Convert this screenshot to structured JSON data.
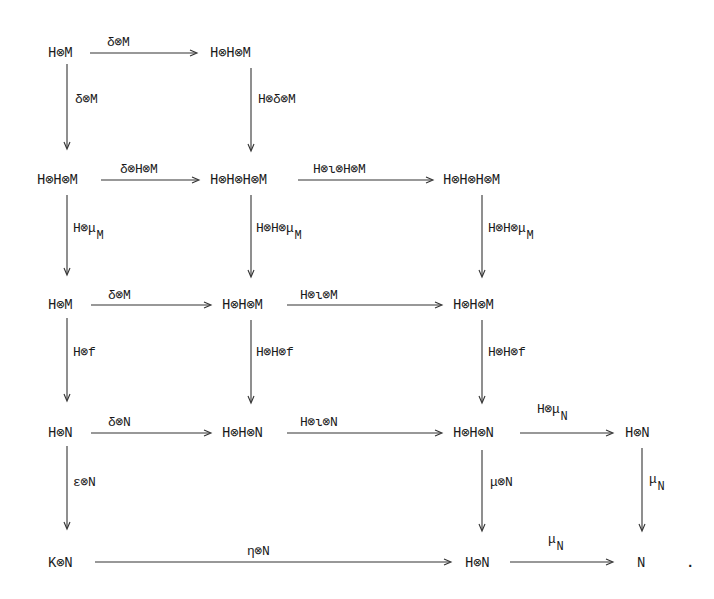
{
  "diagram": {
    "type": "commutative-diagram",
    "nodes": {
      "r1c1": "H⊗M",
      "r1c2": "H⊗H⊗M",
      "r2c1": "H⊗H⊗M",
      "r2c2": "H⊗H⊗H⊗M",
      "r2c3": "H⊗H⊗H⊗M",
      "r3c1": "H⊗M",
      "r3c2": "H⊗H⊗M",
      "r3c3": "H⊗H⊗M",
      "r4c1": "H⊗N",
      "r4c2": "H⊗H⊗N",
      "r4c3": "H⊗H⊗N",
      "r4c4": "H⊗N",
      "r5c1": "K⊗N",
      "r5c3": "H⊗N",
      "r5c4": "N",
      "period": "."
    },
    "edges": {
      "r1_h1": {
        "label": "δ⊗M"
      },
      "r1c1_down": {
        "label": "δ⊗M"
      },
      "r1c2_down": {
        "label": "H⊗δ⊗M"
      },
      "r2_h1": {
        "label": "δ⊗H⊗M"
      },
      "r2_h2": {
        "label": "H⊗ι⊗H⊗M"
      },
      "r2c1_down": {
        "label": "H⊗μ",
        "sub": "M"
      },
      "r2c2_down": {
        "label": "H⊗H⊗μ",
        "sub": "M"
      },
      "r2c3_down": {
        "label": "H⊗H⊗μ",
        "sub": "M"
      },
      "r3_h1": {
        "label": "δ⊗M"
      },
      "r3_h2": {
        "label": "H⊗ι⊗M"
      },
      "r3c1_down": {
        "label": "H⊗f"
      },
      "r3c2_down": {
        "label": "H⊗H⊗f"
      },
      "r3c3_down": {
        "label": "H⊗H⊗f"
      },
      "r4_h1": {
        "label": "δ⊗N"
      },
      "r4_h2": {
        "label": "H⊗ι⊗N"
      },
      "r4_h3": {
        "label": "H⊗μ",
        "sub": "N"
      },
      "r4c1_down": {
        "label": "ε⊗N"
      },
      "r4c3_down": {
        "label": "μ⊗N"
      },
      "r4c4_down": {
        "label": "μ",
        "sub": "N"
      },
      "r5_h1": {
        "label": "η⊗N"
      },
      "r5_h2": {
        "label": "μ",
        "sub": "N"
      }
    }
  }
}
